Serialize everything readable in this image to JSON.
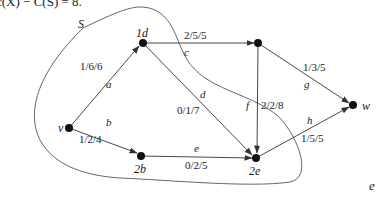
{
  "header": {
    "text": "c(X) − C(S) = 8."
  },
  "set_label": "S",
  "nodes": {
    "v": {
      "label": "v",
      "x": 69,
      "y": 128
    },
    "d": {
      "label": "1d",
      "x": 143,
      "y": 43
    },
    "t": {
      "label": "",
      "x": 258,
      "y": 43
    },
    "w": {
      "label": "w",
      "x": 353,
      "y": 105
    },
    "b": {
      "label": "2b",
      "x": 141,
      "y": 156
    },
    "e": {
      "label": "2e",
      "x": 256,
      "y": 158
    }
  },
  "edges": [
    {
      "name": "a",
      "from": "v",
      "to": "d",
      "flow": "1/6/6"
    },
    {
      "name": "b",
      "from": "v",
      "to": "b",
      "flow": "1/2/4"
    },
    {
      "name": "c",
      "from": "d",
      "to": "t",
      "flow": "2/5/5"
    },
    {
      "name": "d",
      "from": "d",
      "to": "e",
      "flow": "0/1/7"
    },
    {
      "name": "e",
      "from": "b",
      "to": "e",
      "flow": "0/2/5"
    },
    {
      "name": "f",
      "from": "t",
      "to": "e",
      "flow": "2/2/8"
    },
    {
      "name": "g",
      "from": "t",
      "to": "w",
      "flow": "1/3/5"
    },
    {
      "name": "h",
      "from": "e",
      "to": "w",
      "flow": "1/5/5"
    }
  ],
  "colors": {
    "line": "#333333",
    "node": "#111111",
    "boundary": "#555555"
  },
  "corner_fragment": "e"
}
